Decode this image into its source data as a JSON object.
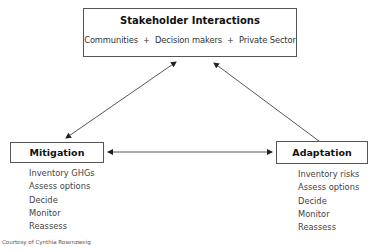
{
  "top": {
    "title": "Stakeholder Interactions",
    "stakeholders": [
      "Communities",
      "Decision makers",
      "Private Sector"
    ],
    "separator": "+"
  },
  "mitigation": {
    "title": "Mitigation",
    "steps": [
      "Inventory GHGs",
      "Assess options",
      "Decide",
      "Monitor",
      "Reassess"
    ]
  },
  "adaptation": {
    "title": "Adaptation",
    "steps": [
      "Inventory risks",
      "Assess options",
      "Decide",
      "Monitor",
      "Reassess"
    ]
  },
  "credit": "Courtesy of Cynthia Rosenzweig",
  "colors": {
    "line": "#333333",
    "border": "#555555"
  }
}
